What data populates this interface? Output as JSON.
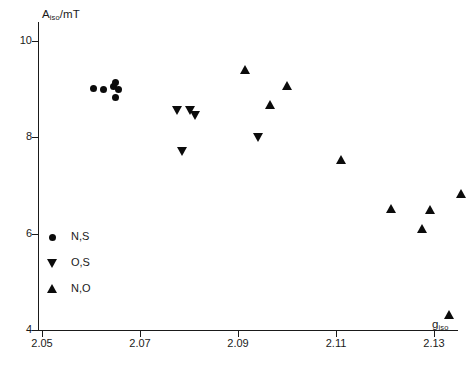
{
  "chart_data": {
    "type": "scatter",
    "title": "",
    "xlabel": "g_iso",
    "ylabel": "A_iso/mT",
    "xlabel_base": "g",
    "xlabel_sub": "iso",
    "ylabel_base": "A",
    "ylabel_sub": "iso",
    "ylabel_unit": "/mT",
    "xlim": [
      2.05,
      2.1395
    ],
    "ylim": [
      4.0,
      10.45
    ],
    "grid": false,
    "legend_position": "lower-left-inside",
    "xticks": [
      2.05,
      2.07,
      2.09,
      2.11,
      2.13
    ],
    "xtick_labels": [
      "2.05",
      "2.07",
      "2.09",
      "2.11",
      "2.13"
    ],
    "yticks": [
      10,
      8,
      6,
      4
    ],
    "ytick_labels": [
      "10",
      "8",
      "6",
      "4"
    ],
    "marker_color": "#0b0b0b",
    "axis_color": "#1a1a1a",
    "background": "#ffffff",
    "series": [
      {
        "name": "N,S",
        "marker": "circle",
        "legend_symbol": "circle-marker",
        "points": [
          {
            "x": 2.0605,
            "y": 9.02
          },
          {
            "x": 2.0625,
            "y": 9.0
          },
          {
            "x": 2.0645,
            "y": 9.05
          },
          {
            "x": 2.065,
            "y": 9.13
          },
          {
            "x": 2.0657,
            "y": 8.99
          },
          {
            "x": 2.065,
            "y": 8.82
          }
        ]
      },
      {
        "name": "O,S",
        "marker": "triangle-down",
        "legend_symbol": "triangle-down-marker",
        "points": [
          {
            "x": 2.0775,
            "y": 8.57
          },
          {
            "x": 2.0803,
            "y": 8.56
          },
          {
            "x": 2.0812,
            "y": 8.47
          },
          {
            "x": 2.0785,
            "y": 7.72
          },
          {
            "x": 2.094,
            "y": 8.0
          }
        ]
      },
      {
        "name": "N,O",
        "marker": "triangle-up",
        "legend_symbol": "triangle-up-marker",
        "points": [
          {
            "x": 2.0915,
            "y": 9.4
          },
          {
            "x": 2.0965,
            "y": 8.68
          },
          {
            "x": 2.1,
            "y": 9.07
          },
          {
            "x": 2.111,
            "y": 7.52
          },
          {
            "x": 2.1212,
            "y": 6.52
          },
          {
            "x": 2.1275,
            "y": 6.1
          },
          {
            "x": 2.1292,
            "y": 6.5
          },
          {
            "x": 2.133,
            "y": 4.32
          },
          {
            "x": 2.1355,
            "y": 6.82
          }
        ]
      }
    ]
  }
}
